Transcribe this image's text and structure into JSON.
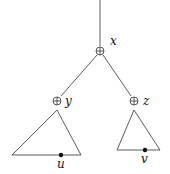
{
  "diagram": {
    "type": "tree",
    "nodes": [
      {
        "id": "x",
        "label": "x",
        "symbol": "⊕"
      },
      {
        "id": "y",
        "label": "y",
        "symbol": "⊕"
      },
      {
        "id": "z",
        "label": "z",
        "symbol": "⊕"
      }
    ],
    "edges": [
      [
        "root",
        "x"
      ],
      [
        "x",
        "y"
      ],
      [
        "x",
        "z"
      ]
    ],
    "subtrees": [
      {
        "parent": "y",
        "leaf_label": "u"
      },
      {
        "parent": "z",
        "leaf_label": "v"
      }
    ],
    "colors": {
      "stroke": "#333333",
      "dot": "#111111"
    }
  }
}
